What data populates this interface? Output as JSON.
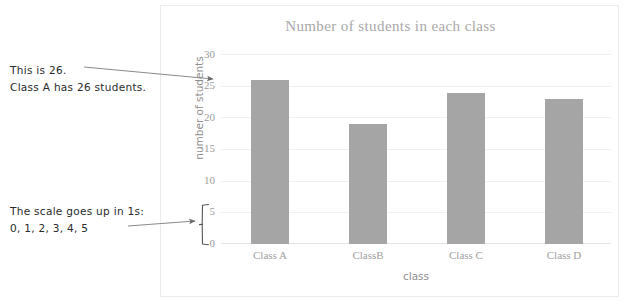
{
  "chart_data": {
    "type": "bar",
    "title": "Number of students in each class",
    "xlabel": "class",
    "ylabel": "number of students",
    "categories": [
      "Class A",
      "ClassB",
      "Class C",
      "Class D"
    ],
    "values": [
      26,
      19,
      24,
      23
    ],
    "ylim": [
      0,
      30
    ],
    "ytick_labels": [
      "0",
      "5",
      "10",
      "15",
      "20",
      "25",
      "30"
    ],
    "ytick_values": [
      0,
      5,
      10,
      15,
      20,
      25,
      30
    ],
    "grid": true,
    "legend": "none",
    "bar_color": "#a5a5a5"
  },
  "annotations": {
    "top": {
      "line1": "This is 26.",
      "line2": "Class A has 26 students.",
      "points_to": "25"
    },
    "bottom": {
      "line1": "The scale goes up in 1s:",
      "line2": "0, 1, 2, 3, 4, 5",
      "points_to": "bracket-0-to-5"
    }
  },
  "colors": {
    "bar": "#a5a5a5",
    "gridline": "#f0f0f0",
    "panel_border": "#ebebeb",
    "title_text": "#a8a8a8",
    "tick_text": "#9a9a9a",
    "annotation_text": "#2b2b2b",
    "arrow": "#5a5a5a"
  }
}
